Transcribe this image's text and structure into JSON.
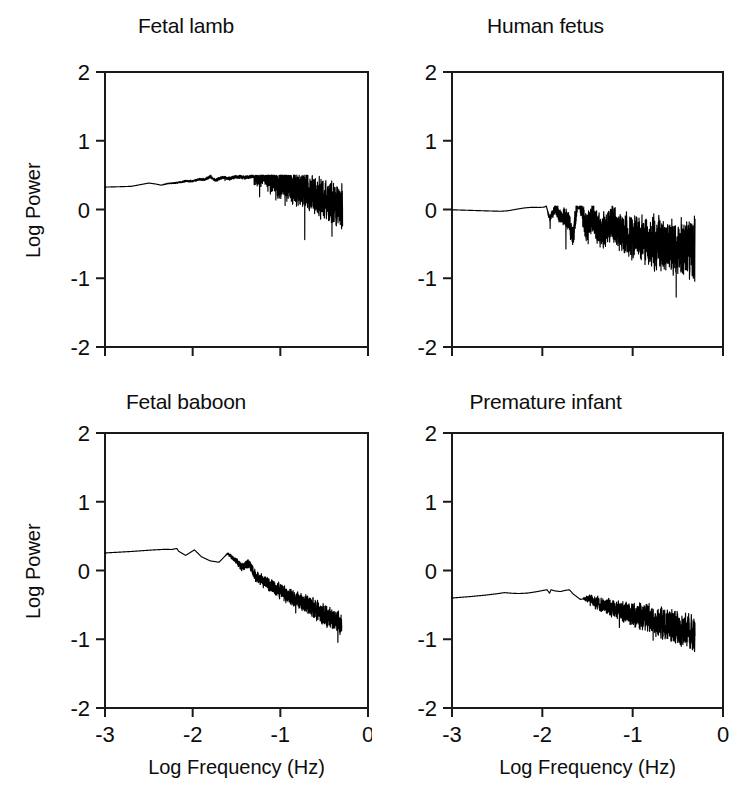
{
  "figure": {
    "width": 743,
    "height": 793,
    "background": "#ffffff",
    "ink": "#000000",
    "rows": 2,
    "cols": 2
  },
  "axes": {
    "xlabel": "Log Frequency (Hz)",
    "ylabel": "Log Power",
    "xticks": [
      "-3",
      "-2",
      "-1",
      "0"
    ],
    "yticks": [
      "2",
      "1",
      "0",
      "-1",
      "-2"
    ],
    "xlim": [
      -3,
      0
    ],
    "ylim": [
      -2,
      2
    ],
    "grid": false,
    "frame": "box"
  },
  "chart_data": [
    {
      "type": "line",
      "title": "Fetal lamb",
      "panel": "top-left",
      "xlabel": "Log Frequency (Hz)",
      "ylabel": "Log Power",
      "xlim": [
        -3,
        0
      ],
      "ylim": [
        -2,
        2
      ],
      "xticks": [
        -3,
        -2,
        -1,
        0
      ],
      "yticks": [
        2,
        1,
        0,
        -1,
        -2
      ],
      "xticklabels": [
        "",
        "",
        "",
        ""
      ],
      "yticklabels": [
        "2",
        "1",
        "0",
        "-1",
        "-2"
      ],
      "grid": false,
      "data_x_range": [
        -3.0,
        -0.29
      ],
      "series": [
        {
          "name": "fetal-lamb-spectrum",
          "slope": -0.78,
          "intercept": -0.35,
          "noise_start_x": -2.35,
          "noise_max": 0.3,
          "anchor_points": [
            {
              "x": -3.0,
              "y": 1.95
            },
            {
              "x": -2.82,
              "y": 1.9
            },
            {
              "x": -2.7,
              "y": 1.86
            },
            {
              "x": -2.62,
              "y": 1.7
            },
            {
              "x": -2.5,
              "y": 1.46
            },
            {
              "x": -2.42,
              "y": 1.58
            },
            {
              "x": -2.36,
              "y": 1.72
            },
            {
              "x": -2.28,
              "y": 1.5
            },
            {
              "x": -2.18,
              "y": 1.44
            },
            {
              "x": -2.08,
              "y": 1.22
            },
            {
              "x": -2.0,
              "y": 1.24
            },
            {
              "x": -1.92,
              "y": 0.98
            },
            {
              "x": -1.86,
              "y": 1.05
            },
            {
              "x": -1.8,
              "y": 0.7
            },
            {
              "x": -1.74,
              "y": 1.12
            },
            {
              "x": -1.66,
              "y": 0.78
            },
            {
              "x": -1.58,
              "y": 0.92
            },
            {
              "x": -1.5,
              "y": 0.7
            },
            {
              "x": -1.4,
              "y": 0.8
            },
            {
              "x": -1.28,
              "y": 0.55
            },
            {
              "x": -1.1,
              "y": 0.45
            },
            {
              "x": -0.9,
              "y": 0.35
            },
            {
              "x": -0.7,
              "y": 0.25
            },
            {
              "x": -0.5,
              "y": 0.15
            },
            {
              "x": -0.29,
              "y": 0.02
            }
          ],
          "envelope_min": -0.55,
          "envelope_max": 0.5
        }
      ]
    },
    {
      "type": "line",
      "title": "Human fetus",
      "panel": "top-right",
      "xlabel": "Log Frequency (Hz)",
      "ylabel": "",
      "xlim": [
        -3,
        0
      ],
      "ylim": [
        -2,
        2
      ],
      "xticks": [
        -3,
        -2,
        -1,
        0
      ],
      "yticks": [
        2,
        1,
        0,
        -1,
        -2
      ],
      "xticklabels": [
        "",
        "",
        "",
        ""
      ],
      "yticklabels": [
        "2",
        "1",
        "0",
        "-1",
        "-2"
      ],
      "grid": false,
      "data_x_range": [
        -3.0,
        -0.31
      ],
      "series": [
        {
          "name": "human-fetus-spectrum",
          "slope": -0.42,
          "intercept": -0.72,
          "noise_start_x": -1.95,
          "noise_max": 0.42,
          "anchor_points": [
            {
              "x": -3.0,
              "y": 0.5
            },
            {
              "x": -2.8,
              "y": 0.57
            },
            {
              "x": -2.6,
              "y": 0.64
            },
            {
              "x": -2.46,
              "y": 0.68
            },
            {
              "x": -2.38,
              "y": 0.62
            },
            {
              "x": -2.28,
              "y": 0.42
            },
            {
              "x": -2.2,
              "y": 0.28
            },
            {
              "x": -2.12,
              "y": 0.2
            },
            {
              "x": -2.04,
              "y": 0.22
            },
            {
              "x": -1.98,
              "y": 0.18
            },
            {
              "x": -1.92,
              "y": -0.14
            },
            {
              "x": -1.86,
              "y": 0.02
            },
            {
              "x": -1.8,
              "y": -0.1
            },
            {
              "x": -1.74,
              "y": -0.09
            },
            {
              "x": -1.66,
              "y": -0.4
            },
            {
              "x": -1.6,
              "y": 0.28
            },
            {
              "x": -1.52,
              "y": -0.3
            },
            {
              "x": -1.44,
              "y": -0.12
            },
            {
              "x": -1.36,
              "y": -0.35
            },
            {
              "x": -1.24,
              "y": -0.2
            },
            {
              "x": -1.1,
              "y": -0.35
            },
            {
              "x": -0.9,
              "y": -0.45
            },
            {
              "x": -0.7,
              "y": -0.5
            },
            {
              "x": -0.5,
              "y": -0.55
            },
            {
              "x": -0.31,
              "y": -0.58
            }
          ],
          "envelope_min": -1.35,
          "envelope_max": 0.05
        }
      ]
    },
    {
      "type": "line",
      "title": "Fetal baboon",
      "panel": "bottom-left",
      "xlabel": "Log Frequency (Hz)",
      "ylabel": "Log Power",
      "xlim": [
        -3,
        0
      ],
      "ylim": [
        -2,
        2
      ],
      "xticks": [
        -3,
        -2,
        -1,
        0
      ],
      "yticks": [
        2,
        1,
        0,
        -1,
        -2
      ],
      "xticklabels": [
        "-3",
        "-2",
        "-1",
        "0"
      ],
      "yticklabels": [
        "2",
        "1",
        "0",
        "-1",
        "-2"
      ],
      "grid": false,
      "data_x_range": [
        -3.0,
        -0.3
      ],
      "series": [
        {
          "name": "fetal-baboon-spectrum",
          "slope": -0.6,
          "intercept": -0.95,
          "noise_start_x": -1.62,
          "noise_max": 0.16,
          "anchor_points": [
            {
              "x": -3.0,
              "y": 0.86
            },
            {
              "x": -2.7,
              "y": 0.68
            },
            {
              "x": -2.46,
              "y": 0.5
            },
            {
              "x": -2.32,
              "y": 0.42
            },
            {
              "x": -2.24,
              "y": 0.44
            },
            {
              "x": -2.16,
              "y": 0.28
            },
            {
              "x": -2.08,
              "y": 0.22
            },
            {
              "x": -1.98,
              "y": 0.3
            },
            {
              "x": -1.9,
              "y": 0.2
            },
            {
              "x": -1.8,
              "y": 0.14
            },
            {
              "x": -1.7,
              "y": 0.12
            },
            {
              "x": -1.6,
              "y": 0.25
            },
            {
              "x": -1.52,
              "y": 0.16
            },
            {
              "x": -1.44,
              "y": 0.05
            },
            {
              "x": -1.36,
              "y": 0.1
            },
            {
              "x": -1.28,
              "y": -0.08
            },
            {
              "x": -1.16,
              "y": -0.18
            },
            {
              "x": -1.0,
              "y": -0.3
            },
            {
              "x": -0.82,
              "y": -0.42
            },
            {
              "x": -0.62,
              "y": -0.55
            },
            {
              "x": -0.44,
              "y": -0.68
            },
            {
              "x": -0.3,
              "y": -0.78
            }
          ],
          "envelope_min": -1.05,
          "envelope_max": 0.32
        }
      ]
    },
    {
      "type": "line",
      "title": "Premature infant",
      "panel": "bottom-right",
      "xlabel": "Log Frequency (Hz)",
      "ylabel": "",
      "xlim": [
        -3,
        0
      ],
      "ylim": [
        -2,
        2
      ],
      "xticks": [
        -3,
        -2,
        -1,
        0
      ],
      "yticks": [
        2,
        1,
        0,
        -1,
        -2
      ],
      "xticklabels": [
        "-3",
        "-2",
        "-1",
        "0"
      ],
      "yticklabels": [
        "2",
        "1",
        "0",
        "-1",
        "-2"
      ],
      "grid": false,
      "data_x_range": [
        -3.0,
        -0.31
      ],
      "series": [
        {
          "name": "premature-infant-spectrum",
          "slope": -0.58,
          "intercept": -1.08,
          "noise_start_x": -1.55,
          "noise_max": 0.26,
          "anchor_points": [
            {
              "x": -3.0,
              "y": 0.72
            },
            {
              "x": -2.8,
              "y": 0.55
            },
            {
              "x": -2.62,
              "y": 0.36
            },
            {
              "x": -2.5,
              "y": 0.2
            },
            {
              "x": -2.42,
              "y": 0.07
            },
            {
              "x": -2.34,
              "y": 0.14
            },
            {
              "x": -2.26,
              "y": 0.18
            },
            {
              "x": -2.16,
              "y": 0.12
            },
            {
              "x": -2.06,
              "y": -0.05
            },
            {
              "x": -1.98,
              "y": -0.22
            },
            {
              "x": -1.92,
              "y": -0.33
            },
            {
              "x": -1.86,
              "y": -0.14
            },
            {
              "x": -1.8,
              "y": -0.06
            },
            {
              "x": -1.74,
              "y": -0.22
            },
            {
              "x": -1.66,
              "y": -0.34
            },
            {
              "x": -1.58,
              "y": -0.42
            },
            {
              "x": -1.48,
              "y": -0.4
            },
            {
              "x": -1.38,
              "y": -0.48
            },
            {
              "x": -1.26,
              "y": -0.52
            },
            {
              "x": -1.1,
              "y": -0.6
            },
            {
              "x": -0.9,
              "y": -0.68
            },
            {
              "x": -0.7,
              "y": -0.75
            },
            {
              "x": -0.5,
              "y": -0.85
            },
            {
              "x": -0.31,
              "y": -0.92
            }
          ],
          "envelope_min": -1.22,
          "envelope_max": -0.28
        }
      ]
    }
  ]
}
